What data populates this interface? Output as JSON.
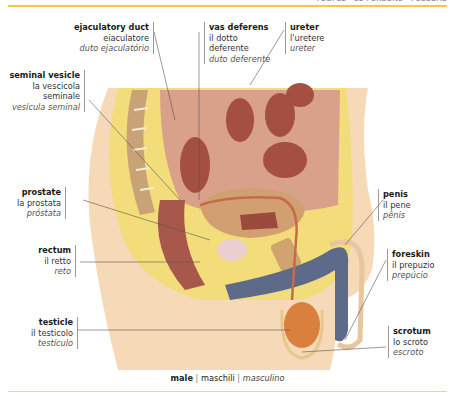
{
  "header": {
    "section_text": "PEOPLE · LE PERSONE · PESSOAS",
    "accent_color": "#f2c84b"
  },
  "labels": [
    {
      "id": "ejaculatory-duct",
      "en": "ejaculatory duct",
      "it": "eiaculatore",
      "pt": "duto ejaculatório"
    },
    {
      "id": "vas-deferens",
      "en": "vas deferens",
      "it": "il dotto",
      "it2": "deferente",
      "pt": "duto deferente"
    },
    {
      "id": "ureter",
      "en": "ureter",
      "it": "l'uretere",
      "pt": "ureter"
    },
    {
      "id": "seminal-vesicle",
      "en": "seminal vesicle",
      "it": "la vescicola",
      "it2": "seminale",
      "pt": "vesícula seminal"
    },
    {
      "id": "prostate",
      "en": "prostate",
      "it": "la prostata",
      "pt": "próstata"
    },
    {
      "id": "rectum",
      "en": "rectum",
      "it": "il retto",
      "pt": "reto"
    },
    {
      "id": "testicle",
      "en": "testicle",
      "it": "il testicolo",
      "pt": "testículo"
    },
    {
      "id": "penis",
      "en": "penis",
      "it": "il pene",
      "pt": "pênis"
    },
    {
      "id": "foreskin",
      "en": "foreskin",
      "it": "il prepuzio",
      "pt": "prepúcio"
    },
    {
      "id": "scrotum",
      "en": "scrotum",
      "it": "lo scroto",
      "pt": "escroto"
    }
  ],
  "caption": {
    "en": "male",
    "it": "maschili",
    "pt": "masculino",
    "separator": "|"
  },
  "colors": {
    "skin": "#f6d9b6",
    "fat": "#f3dc7a",
    "muscle": "#b0594a",
    "bone": "#c9a276",
    "vessel_blue": "#5d6a8a",
    "testis": "#d9803e"
  }
}
